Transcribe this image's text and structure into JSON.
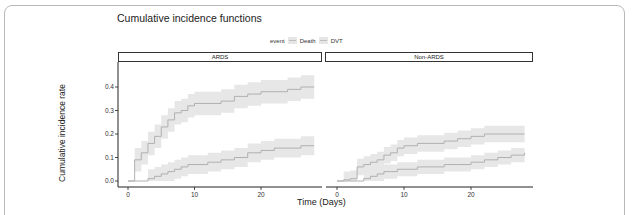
{
  "title": "Cumulative incidence functions",
  "legend": {
    "title": "event",
    "items": [
      {
        "label": "Death",
        "line_color": "#bdbdbd",
        "band_color": "#e6e6e6"
      },
      {
        "label": "DVT",
        "line_color": "#bdbdbd",
        "band_color": "#e6e6e6"
      }
    ]
  },
  "panels": [
    {
      "label": "ARDS"
    },
    {
      "label": "Non-ARDS"
    }
  ],
  "axes": {
    "xlabel": "Time (Days)",
    "ylabel": "Cumulative incidence rate",
    "xticks": [
      "0",
      "10",
      "20"
    ],
    "yticks": [
      "0.0",
      "0.1",
      "0.2",
      "0.3",
      "0.4"
    ]
  },
  "chart_data": {
    "type": "line",
    "title": "Cumulative incidence functions",
    "xlabel": "Time (Days)",
    "ylabel": "Cumulative incidence rate",
    "xlim": [
      0,
      28
    ],
    "ylim": [
      0,
      0.45
    ],
    "legend_position": "top",
    "grid": false,
    "facets": [
      "ARDS",
      "Non-ARDS"
    ],
    "x": [
      0,
      1,
      2,
      3,
      4,
      5,
      6,
      7,
      8,
      9,
      10,
      12,
      14,
      16,
      18,
      20,
      22,
      24,
      26,
      28
    ],
    "series": [
      {
        "name": "DVT",
        "facet": "ARDS",
        "values": [
          0,
          0.09,
          0.12,
          0.16,
          0.19,
          0.23,
          0.26,
          0.29,
          0.3,
          0.32,
          0.33,
          0.33,
          0.34,
          0.36,
          0.37,
          0.38,
          0.38,
          0.39,
          0.4,
          0.4
        ],
        "ci_half_width": 0.05
      },
      {
        "name": "Death",
        "facet": "ARDS",
        "values": [
          0,
          0,
          0,
          0.01,
          0.02,
          0.03,
          0.04,
          0.05,
          0.06,
          0.07,
          0.07,
          0.08,
          0.09,
          0.1,
          0.12,
          0.13,
          0.14,
          0.14,
          0.15,
          0.15
        ],
        "ci_half_width": 0.04
      },
      {
        "name": "DVT",
        "facet": "Non-ARDS",
        "values": [
          0,
          0.005,
          0.01,
          0.06,
          0.07,
          0.08,
          0.09,
          0.11,
          0.12,
          0.14,
          0.15,
          0.16,
          0.16,
          0.17,
          0.18,
          0.19,
          0.2,
          0.2,
          0.2,
          0.2
        ],
        "ci_half_width": 0.035
      },
      {
        "name": "Death",
        "facet": "Non-ARDS",
        "values": [
          0,
          0,
          0,
          0,
          0.01,
          0.02,
          0.03,
          0.04,
          0.04,
          0.05,
          0.05,
          0.06,
          0.06,
          0.07,
          0.07,
          0.08,
          0.09,
          0.1,
          0.11,
          0.12
        ],
        "ci_half_width": 0.03
      }
    ]
  }
}
